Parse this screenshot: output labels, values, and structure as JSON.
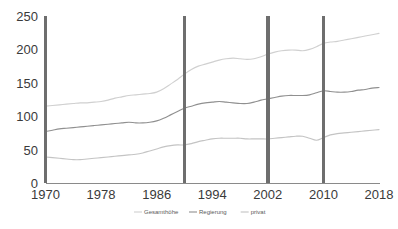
{
  "chart_data": {
    "type": "line",
    "title": "",
    "subtitle": "",
    "xlabel": "",
    "ylabel": "",
    "xlim": [
      1970,
      2018
    ],
    "ylim": [
      0,
      250
    ],
    "grid": false,
    "legend_position": "bottom",
    "x_ticks": [
      "1970",
      "1978",
      "1986",
      "1994",
      "2002",
      "2010",
      "2018"
    ],
    "y_ticks": [
      "0",
      "50",
      "100",
      "150",
      "200",
      "250"
    ],
    "x": [
      1970,
      1971,
      1972,
      1973,
      1974,
      1975,
      1976,
      1977,
      1978,
      1979,
      1980,
      1981,
      1982,
      1983,
      1984,
      1985,
      1986,
      1987,
      1988,
      1989,
      1990,
      1991,
      1992,
      1993,
      1994,
      1995,
      1996,
      1997,
      1998,
      1999,
      2000,
      2001,
      2002,
      2003,
      2004,
      2005,
      2006,
      2007,
      2008,
      2009,
      2010,
      2011,
      2012,
      2013,
      2014,
      2015,
      2016,
      2017,
      2018
    ],
    "series": [
      {
        "name": "Gesamthöhe",
        "color": "#d0d0d0",
        "values": [
          115,
          116,
          117,
          118,
          119,
          120,
          120,
          121,
          122,
          124,
          127,
          129,
          131,
          132,
          133,
          134,
          136,
          141,
          148,
          155,
          163,
          170,
          175,
          178,
          181,
          184,
          186,
          187,
          186,
          185,
          186,
          189,
          193,
          196,
          198,
          199,
          199,
          198,
          200,
          204,
          209,
          211,
          212,
          214,
          216,
          218,
          220,
          222,
          224
        ]
      },
      {
        "name": "Regierung",
        "color": "#909090",
        "values": [
          77,
          79,
          81,
          82,
          83,
          84,
          85,
          86,
          87,
          88,
          89,
          90,
          91,
          90,
          90,
          91,
          93,
          97,
          102,
          107,
          112,
          115,
          118,
          120,
          121,
          122,
          121,
          120,
          119,
          119,
          121,
          124,
          126,
          128,
          130,
          131,
          131,
          131,
          132,
          135,
          138,
          137,
          136,
          136,
          137,
          139,
          140,
          142,
          143
        ]
      },
      {
        "name": "privat",
        "color": "#c4c4c4",
        "values": [
          39,
          38,
          37,
          36,
          35,
          35,
          36,
          37,
          38,
          39,
          40,
          41,
          42,
          43,
          45,
          48,
          51,
          54,
          56,
          57,
          57,
          59,
          62,
          64,
          66,
          67,
          67,
          67,
          67,
          66,
          66,
          66,
          66,
          67,
          68,
          69,
          70,
          70,
          67,
          64,
          68,
          72,
          74,
          75,
          76,
          77,
          78,
          79,
          80
        ]
      }
    ],
    "markers": {
      "color": "#6e6e6e",
      "years": [
        1970,
        1990,
        2002,
        2010
      ]
    },
    "axis_color": "#8a8a8a"
  }
}
